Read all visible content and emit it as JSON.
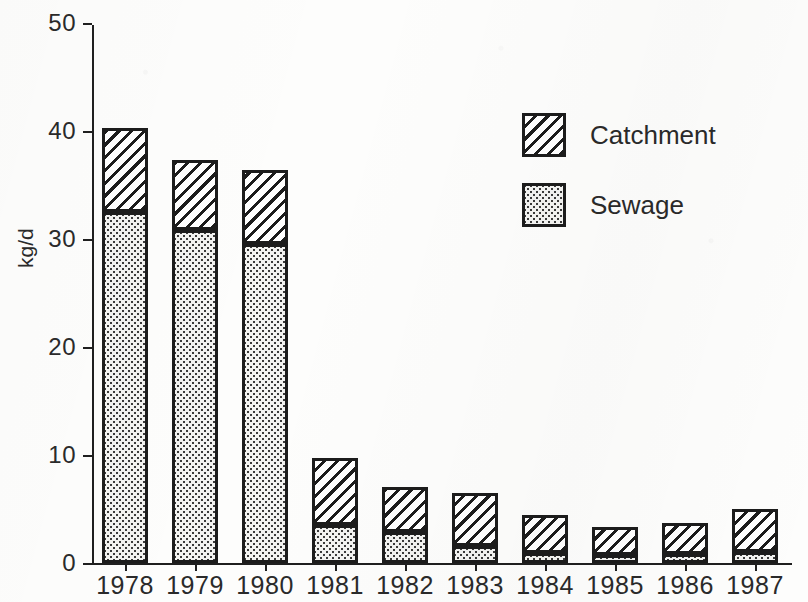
{
  "chart_data": {
    "type": "bar",
    "stacked": true,
    "title": "",
    "xlabel": "",
    "ylabel": "kg/d",
    "ylim": [
      0,
      50
    ],
    "ytick_labels": [
      "0",
      "10",
      "20",
      "30",
      "40",
      "50"
    ],
    "ytick_values": [
      0,
      10,
      20,
      30,
      40,
      50
    ],
    "grid": false,
    "legend_position": "upper-right-inside",
    "categories": [
      "1978",
      "1979",
      "1980",
      "1981",
      "1982",
      "1983",
      "1984",
      "1985",
      "1986",
      "1987"
    ],
    "series": [
      {
        "name": "Sewage",
        "pattern": "dotted",
        "color": "#f3f3f1",
        "values": [
          32.5,
          30.8,
          29.5,
          3.5,
          2.9,
          1.6,
          0.9,
          0.7,
          0.8,
          1.0
        ]
      },
      {
        "name": "Catchment",
        "pattern": "diagonal-hatch",
        "color": "#ffffff",
        "values": [
          7.8,
          6.5,
          6.9,
          6.2,
          4.1,
          4.9,
          3.5,
          2.6,
          2.9,
          4.0
        ]
      }
    ],
    "totals": [
      40.3,
      37.3,
      36.4,
      9.7,
      7.0,
      6.5,
      4.4,
      3.3,
      3.7,
      5.0
    ]
  },
  "legend": {
    "entries": [
      {
        "label": "Catchment",
        "pattern": "diagonal-hatch"
      },
      {
        "label": "Sewage",
        "pattern": "dotted"
      }
    ]
  },
  "axis": {
    "y_title": "kg/d"
  },
  "colors": {
    "ink": "#1c1c1c",
    "paper": "#fdfdfc",
    "stipple": "#3a3a3a"
  }
}
